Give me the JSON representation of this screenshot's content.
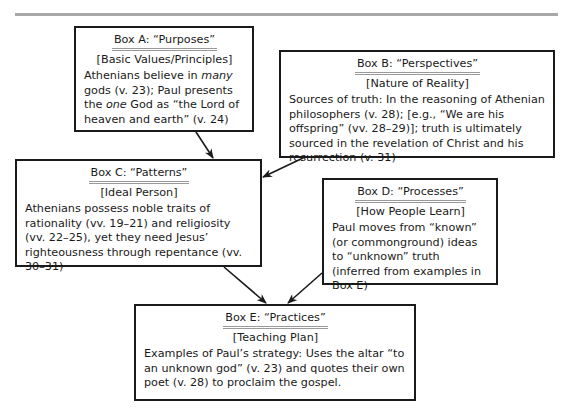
{
  "boxes": {
    "a": {
      "title": "Box A: “Purposes”",
      "subtitle": "[Basic Values/Principles]",
      "body_parts": [
        "Athenians believe in ",
        "many",
        " gods (v. 23); Paul presents the ",
        "one",
        " God as “the Lord of heaven and earth” (v. 24)"
      ]
    },
    "b": {
      "title": "Box B: “Perspectives”",
      "subtitle": "[Nature of Reality]",
      "body": "Sources of truth: In the reasoning of Athenian philosophers (v. 28); [e.g., “We are his offspring” (vv. 28–29)]; truth is ultimately sourced in the revelation of Christ and his resurrection (v. 31)"
    },
    "c": {
      "title": "Box C: “Patterns”",
      "subtitle": "[Ideal Person]",
      "body": "Athenians possess noble traits of rationality (vv. 19–21) and religiosity (vv. 22–25), yet they need Jesus’ righteousness through repentance (vv. 30–31)"
    },
    "d": {
      "title": "Box D: “Processes”",
      "subtitle": "[How People Learn]",
      "body": "Paul moves from “known” (or commonground) ideas to “unknown” truth (inferred from examples in Box E)"
    },
    "e": {
      "title": "Box E: “Practices”",
      "subtitle": "[Teaching Plan]",
      "body": "Examples of Paul’s strategy: Uses the altar “to an unknown god” (v. 23) and quotes their own poet (v. 28) to proclaim the gospel."
    }
  },
  "arrows": [
    {
      "from": "Box A",
      "to": "Box C"
    },
    {
      "from": "Box B",
      "to": "Box C"
    },
    {
      "from": "Box C",
      "to": "Box E"
    },
    {
      "from": "Box D",
      "to": "Box E"
    }
  ],
  "colors": {
    "border": "#1a1a1a",
    "title_underline": "#9a9a9a",
    "top_rule": "#a8a8a8"
  }
}
